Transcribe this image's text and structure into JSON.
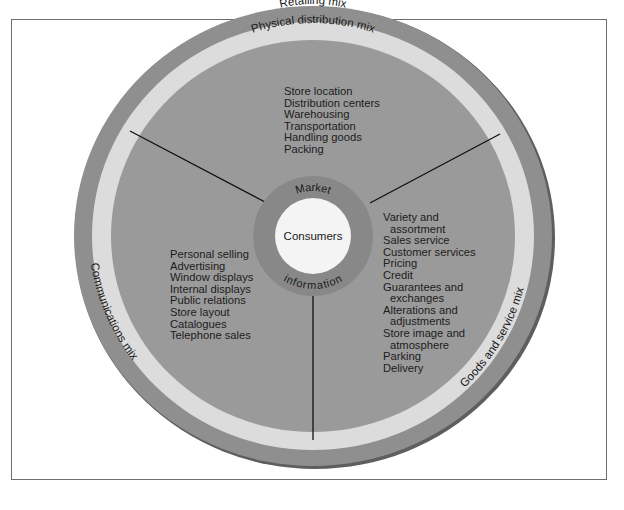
{
  "diagram": {
    "outer_ring_label": "Retailing mix",
    "colors": {
      "outer_ring": "#8f8f8f",
      "light_band": "#dcdcdc",
      "sector_fill": "#9a9a9a",
      "market_ring": "#888888",
      "core": "#f4f4f4",
      "divider": "#111111",
      "frame": "#6e6e6e"
    },
    "core": {
      "label": "Consumers",
      "ring_top_label": "Market",
      "ring_bottom_label": "information"
    },
    "sectors": {
      "physical_distribution": {
        "band_label": "Physical distribution mix",
        "items": [
          "Store location",
          "Distribution centers",
          "Warehousing",
          "Transportation",
          "Handling goods",
          "Packing"
        ]
      },
      "communications": {
        "band_label": "Communications mix",
        "items": [
          "Personal selling",
          "Advertising",
          "Window displays",
          "Internal displays",
          "Public relations",
          "Store layout",
          "Catalogues",
          "Telephone sales"
        ]
      },
      "goods_and_service": {
        "band_label": "Goods and service mix",
        "items": [
          {
            "line1": "Variety and",
            "line2": "assortment"
          },
          {
            "line1": "Sales service"
          },
          {
            "line1": "Customer services"
          },
          {
            "line1": "Pricing"
          },
          {
            "line1": "Credit"
          },
          {
            "line1": "Guarantees and",
            "line2": "exchanges"
          },
          {
            "line1": "Alterations and",
            "line2": "adjustments"
          },
          {
            "line1": "Store image and",
            "line2": "atmosphere"
          },
          {
            "line1": "Parking"
          },
          {
            "line1": "Delivery"
          }
        ]
      }
    }
  }
}
